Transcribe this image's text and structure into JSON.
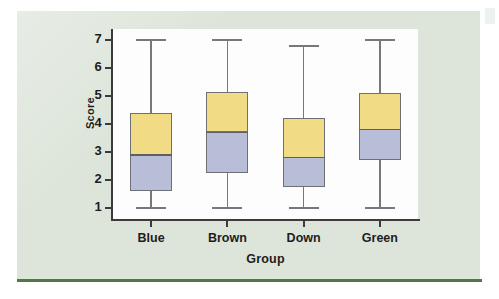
{
  "figure": {
    "background_color": "#ffffff",
    "panel_color": "#dde5da",
    "plot_background_color": "#fdfdfd",
    "rule_color": "#4c7a43",
    "axis_color": "#3b3b3b"
  },
  "chart_data": {
    "type": "box",
    "title": "",
    "xlabel": "Group",
    "ylabel": "Score",
    "categories": [
      "Blue",
      "Brown",
      "Down",
      "Green"
    ],
    "ylim": [
      0.6,
      7.4
    ],
    "yticks": [
      1,
      2,
      3,
      4,
      5,
      6,
      7
    ],
    "ytick_labels": [
      "1",
      "2",
      "3",
      "4",
      "5",
      "6",
      "7"
    ],
    "grid": false,
    "legend": "none",
    "box_fill_upper_color": "#f1dc85",
    "box_fill_lower_color": "#b9bed8",
    "box_edge_color": "#6e7076",
    "whisker_color": "#76787c",
    "boxes": [
      {
        "label": "Blue",
        "whisker_low": 1.0,
        "q1": 1.6,
        "median": 2.9,
        "q3": 4.4,
        "whisker_high": 7.0
      },
      {
        "label": "Brown",
        "whisker_low": 1.0,
        "q1": 2.25,
        "median": 3.7,
        "q3": 5.15,
        "whisker_high": 7.0
      },
      {
        "label": "Down",
        "whisker_low": 1.0,
        "q1": 1.75,
        "median": 2.8,
        "q3": 4.2,
        "whisker_high": 6.8
      },
      {
        "label": "Green",
        "whisker_low": 1.0,
        "q1": 2.7,
        "median": 3.8,
        "q3": 5.1,
        "whisker_high": 7.0
      }
    ]
  }
}
